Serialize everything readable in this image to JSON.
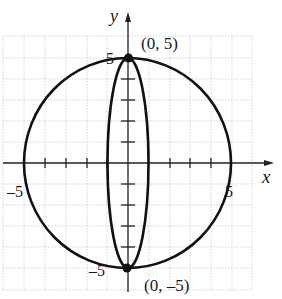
{
  "figure": {
    "type": "coordinate-graph",
    "axes": {
      "x_label": "x",
      "y_label": "y",
      "range": [
        -5,
        5
      ]
    },
    "tick_labels": {
      "x_neg": "-5",
      "x_pos": "5",
      "y_pos": "5",
      "y_neg": "-5"
    },
    "points": [
      {
        "label": "(0, 5)",
        "x": 0,
        "y": 5
      },
      {
        "label": "(0, -5)",
        "x": 0,
        "y": -5
      }
    ],
    "curves": [
      {
        "name": "circle",
        "equation": "x^2 + y^2 = 25",
        "rx": 5,
        "ry": 5
      },
      {
        "name": "ellipse",
        "rx": 1,
        "ry": 5
      }
    ],
    "colors": {
      "curve": "#111111",
      "grid": "#c8c8c8",
      "axis": "#222222"
    }
  }
}
